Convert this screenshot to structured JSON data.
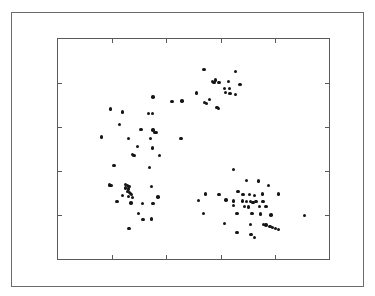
{
  "figure": {
    "width": 375,
    "height": 296,
    "background_color": "#ffffff",
    "outer_frame": {
      "x": 11,
      "y": 12,
      "width": 353,
      "height": 275,
      "color": "#6b6b6b"
    },
    "plot_frame": {
      "x": 57,
      "y": 38,
      "width": 273,
      "height": 222,
      "color": "#5a5a5a"
    }
  },
  "chart_data": {
    "type": "scatter",
    "title": "",
    "subtitle": "",
    "xlabel": "",
    "ylabel": "",
    "xlim": [
      0,
      1
    ],
    "ylim": [
      0,
      1
    ],
    "grid": false,
    "legend": null,
    "annotations": [],
    "marker": {
      "shape": "circle",
      "color": "#151515",
      "size_px": 3.4,
      "filled": true
    },
    "xticks": [
      0.2,
      0.4,
      0.6,
      0.8
    ],
    "yticks": [
      0.2,
      0.4,
      0.6,
      0.8
    ],
    "xtick_labels": [],
    "ytick_labels": [],
    "n_points": 108,
    "clusters": [
      {
        "name": "top-cluster",
        "approx_center": [
          0.6,
          0.77
        ],
        "count": 19
      },
      {
        "name": "left-cluster",
        "approx_center": [
          0.3,
          0.45
        ],
        "count": 44
      },
      {
        "name": "right-cluster",
        "approx_center": [
          0.7,
          0.28
        ],
        "count": 45
      }
    ],
    "points": [
      [
        0.539,
        0.861
      ],
      [
        0.582,
        0.814
      ],
      [
        0.57,
        0.806
      ],
      [
        0.576,
        0.802
      ],
      [
        0.594,
        0.801
      ],
      [
        0.629,
        0.806
      ],
      [
        0.615,
        0.776
      ],
      [
        0.632,
        0.774
      ],
      [
        0.656,
        0.852
      ],
      [
        0.672,
        0.794
      ],
      [
        0.618,
        0.756
      ],
      [
        0.634,
        0.752
      ],
      [
        0.654,
        0.749
      ],
      [
        0.511,
        0.754
      ],
      [
        0.56,
        0.724
      ],
      [
        0.541,
        0.712
      ],
      [
        0.549,
        0.708
      ],
      [
        0.587,
        0.69
      ],
      [
        0.593,
        0.685
      ],
      [
        0.35,
        0.736
      ],
      [
        0.42,
        0.716
      ],
      [
        0.458,
        0.718
      ],
      [
        0.193,
        0.682
      ],
      [
        0.237,
        0.668
      ],
      [
        0.335,
        0.662
      ],
      [
        0.349,
        0.662
      ],
      [
        0.228,
        0.61
      ],
      [
        0.306,
        0.588
      ],
      [
        0.35,
        0.586
      ],
      [
        0.358,
        0.576
      ],
      [
        0.363,
        0.574
      ],
      [
        0.161,
        0.554
      ],
      [
        0.26,
        0.548
      ],
      [
        0.342,
        0.547
      ],
      [
        0.454,
        0.548
      ],
      [
        0.294,
        0.512
      ],
      [
        0.348,
        0.505
      ],
      [
        0.274,
        0.476
      ],
      [
        0.281,
        0.47
      ],
      [
        0.374,
        0.47
      ],
      [
        0.206,
        0.424
      ],
      [
        0.337,
        0.415
      ],
      [
        0.189,
        0.337
      ],
      [
        0.196,
        0.333
      ],
      [
        0.249,
        0.338
      ],
      [
        0.257,
        0.334
      ],
      [
        0.262,
        0.329
      ],
      [
        0.25,
        0.322
      ],
      [
        0.26,
        0.318
      ],
      [
        0.345,
        0.329
      ],
      [
        0.256,
        0.306
      ],
      [
        0.264,
        0.303
      ],
      [
        0.268,
        0.298
      ],
      [
        0.272,
        0.294
      ],
      [
        0.238,
        0.288
      ],
      [
        0.261,
        0.284
      ],
      [
        0.276,
        0.28
      ],
      [
        0.369,
        0.282
      ],
      [
        0.218,
        0.26
      ],
      [
        0.27,
        0.255
      ],
      [
        0.311,
        0.252
      ],
      [
        0.35,
        0.252
      ],
      [
        0.296,
        0.206
      ],
      [
        0.314,
        0.18
      ],
      [
        0.345,
        0.182
      ],
      [
        0.262,
        0.14
      ],
      [
        0.648,
        0.406
      ],
      [
        0.696,
        0.358
      ],
      [
        0.74,
        0.354
      ],
      [
        0.776,
        0.334
      ],
      [
        0.544,
        0.296
      ],
      [
        0.594,
        0.292
      ],
      [
        0.664,
        0.306
      ],
      [
        0.682,
        0.294
      ],
      [
        0.706,
        0.292
      ],
      [
        0.726,
        0.29
      ],
      [
        0.755,
        0.296
      ],
      [
        0.814,
        0.296
      ],
      [
        0.518,
        0.266
      ],
      [
        0.62,
        0.268
      ],
      [
        0.648,
        0.264
      ],
      [
        0.68,
        0.264
      ],
      [
        0.696,
        0.262
      ],
      [
        0.71,
        0.26
      ],
      [
        0.72,
        0.258
      ],
      [
        0.73,
        0.26
      ],
      [
        0.756,
        0.262
      ],
      [
        0.648,
        0.242
      ],
      [
        0.688,
        0.238
      ],
      [
        0.702,
        0.236
      ],
      [
        0.744,
        0.238
      ],
      [
        0.768,
        0.238
      ],
      [
        0.538,
        0.208
      ],
      [
        0.66,
        0.206
      ],
      [
        0.716,
        0.206
      ],
      [
        0.748,
        0.204
      ],
      [
        0.786,
        0.2
      ],
      [
        0.91,
        0.198
      ],
      [
        0.614,
        0.162
      ],
      [
        0.71,
        0.156
      ],
      [
        0.758,
        0.158
      ],
      [
        0.768,
        0.154
      ],
      [
        0.782,
        0.148
      ],
      [
        0.792,
        0.142
      ],
      [
        0.802,
        0.138
      ],
      [
        0.814,
        0.134
      ],
      [
        0.66,
        0.12
      ],
      [
        0.726,
        0.098
      ],
      [
        0.712,
        0.11
      ]
    ]
  }
}
